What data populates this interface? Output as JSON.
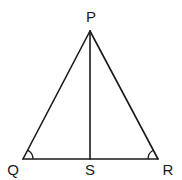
{
  "diagram": {
    "type": "geometry-triangle",
    "points": {
      "P": {
        "label": "P"
      },
      "Q": {
        "label": "Q"
      },
      "R": {
        "label": "R"
      },
      "S": {
        "label": "S"
      }
    },
    "segments": [
      "PQ",
      "PR",
      "QR",
      "PS"
    ],
    "angle_marks": [
      "PQR",
      "PRQ"
    ],
    "line_color": "#1a1a1a"
  }
}
